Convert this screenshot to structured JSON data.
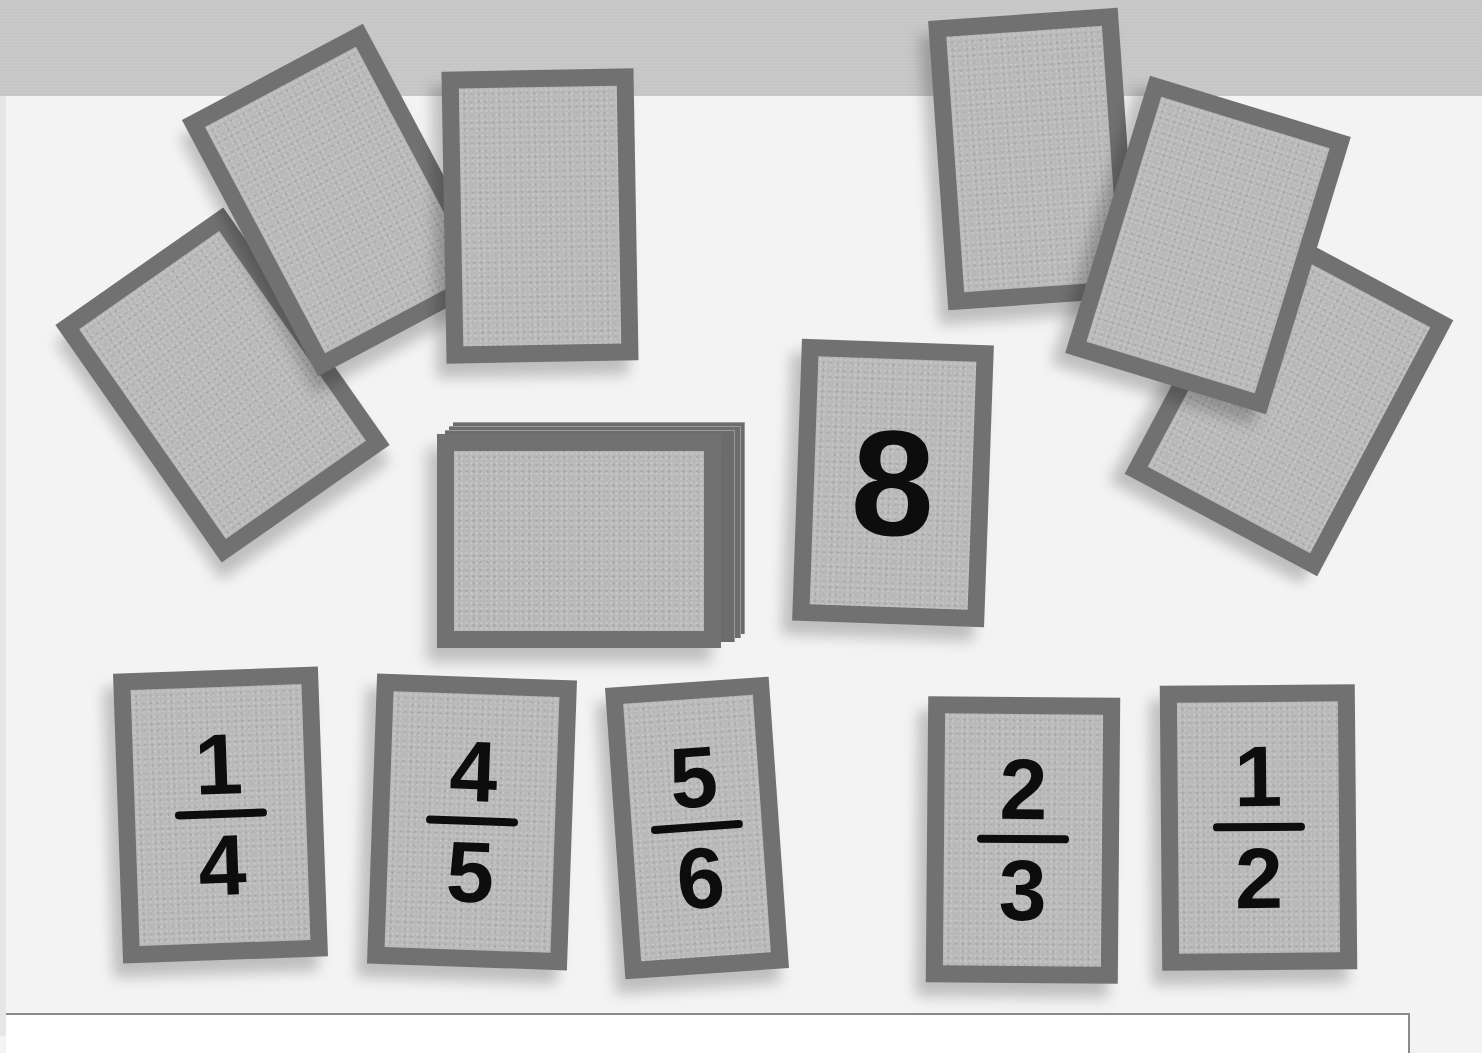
{
  "scene": {
    "description": "Photo of textured gray cards scattered on a white surface; bottom row shows fraction cards",
    "colors": {
      "background": "#f3f3f3",
      "top_band": "#c6c6c6",
      "card_border": "#717171",
      "card_face": "#b9b9b9",
      "digit": "#0d0d0d"
    }
  },
  "center": {
    "revealed_card": {
      "value": "8"
    },
    "deck": {
      "state": "face-down stack"
    }
  },
  "face_down_cards": {
    "top_left": [
      "blank",
      "blank",
      "blank"
    ],
    "top_right": [
      "blank",
      "blank",
      "blank"
    ]
  },
  "fraction_cards": [
    {
      "numerator": "1",
      "denominator": "4"
    },
    {
      "numerator": "4",
      "denominator": "5"
    },
    {
      "numerator": "5",
      "denominator": "6"
    },
    {
      "numerator": "2",
      "denominator": "3"
    },
    {
      "numerator": "1",
      "denominator": "2"
    }
  ]
}
